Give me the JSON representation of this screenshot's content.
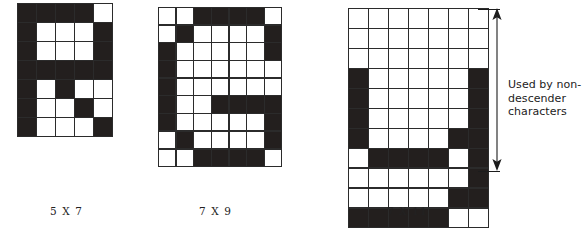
{
  "figure": {
    "background_color": "#ffffff",
    "dot_on_color": "#231f1e",
    "dot_off_color": "#ffffff",
    "grid_line_color": "#2b2b2b"
  },
  "grids": [
    {
      "id": "grid-5x7",
      "caption": "5 X 7",
      "cols": 5,
      "rows": 7,
      "cell_px": 17.6,
      "character": "R",
      "caption_left": 50,
      "caption_top": 205,
      "pattern": [
        [
          1,
          1,
          1,
          1,
          0
        ],
        [
          1,
          0,
          0,
          0,
          1
        ],
        [
          1,
          0,
          0,
          0,
          1
        ],
        [
          1,
          1,
          1,
          1,
          1
        ],
        [
          1,
          0,
          1,
          0,
          0
        ],
        [
          1,
          0,
          0,
          1,
          0
        ],
        [
          1,
          0,
          0,
          0,
          1
        ]
      ]
    },
    {
      "id": "grid-7x9",
      "caption": "7 X 9",
      "cols": 7,
      "rows": 9,
      "cell_px": 16.3,
      "character": "G",
      "caption_left": 199,
      "caption_top": 205,
      "pattern": [
        [
          0,
          0,
          1,
          1,
          1,
          1,
          0
        ],
        [
          0,
          1,
          0,
          0,
          0,
          0,
          1
        ],
        [
          1,
          0,
          0,
          0,
          0,
          0,
          1
        ],
        [
          1,
          0,
          0,
          0,
          0,
          0,
          0
        ],
        [
          1,
          0,
          0,
          0,
          0,
          0,
          0
        ],
        [
          1,
          0,
          0,
          1,
          1,
          1,
          1
        ],
        [
          1,
          0,
          0,
          0,
          0,
          0,
          1
        ],
        [
          0,
          1,
          0,
          0,
          0,
          0,
          1
        ],
        [
          0,
          0,
          1,
          1,
          1,
          1,
          0
        ]
      ]
    },
    {
      "id": "grid-7x11",
      "caption": "7 X 11",
      "cols": 7,
      "rows": 11,
      "cell_px": 18.6,
      "character": "g",
      "caption_left": 387,
      "caption_top": 205,
      "pattern": [
        [
          0,
          0,
          0,
          0,
          0,
          0,
          0
        ],
        [
          0,
          0,
          0,
          0,
          0,
          0,
          0
        ],
        [
          0,
          0,
          0,
          0,
          0,
          0,
          0
        ],
        [
          1,
          0,
          0,
          0,
          0,
          0,
          1
        ],
        [
          1,
          0,
          0,
          0,
          0,
          0,
          1
        ],
        [
          1,
          0,
          0,
          0,
          0,
          0,
          1
        ],
        [
          1,
          0,
          0,
          0,
          0,
          1,
          1
        ],
        [
          0,
          1,
          1,
          1,
          1,
          0,
          1
        ],
        [
          0,
          0,
          0,
          0,
          0,
          0,
          1
        ],
        [
          0,
          0,
          0,
          0,
          0,
          1,
          1
        ],
        [
          1,
          1,
          1,
          1,
          1,
          0,
          0
        ]
      ]
    }
  ],
  "annotation": {
    "id": "non-descender-annotation",
    "lines": [
      "Used by non-",
      "descender",
      "characters"
    ],
    "text": "Used by non-descender characters",
    "arrow": {
      "type": "double-headed-vertical",
      "top_y": 9,
      "bottom_y": 171,
      "color": "#1c1c1c"
    }
  }
}
